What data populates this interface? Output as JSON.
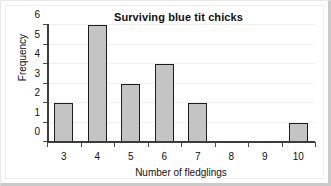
{
  "chart_data": {
    "type": "bar",
    "title": "Surviving blue tit chicks",
    "xlabel": "Number of fledglings",
    "ylabel": "Frequency",
    "categories": [
      "3",
      "4",
      "5",
      "6",
      "7",
      "8",
      "9",
      "10"
    ],
    "values": [
      2,
      6,
      3,
      4,
      2,
      0,
      0,
      1
    ],
    "yticks": [
      "0",
      "1",
      "2",
      "3",
      "4",
      "5",
      "6"
    ],
    "ylim": [
      0,
      6
    ],
    "grid": true,
    "legend": "none",
    "bar_fill_color": "#c4c4c4",
    "bar_border_color": "#1c1c1c",
    "axis_color": "#3c3c3c",
    "gridline_color": "#f0f0f0",
    "background_color": "#ffffff",
    "frame_color": "#c9c9c9"
  }
}
